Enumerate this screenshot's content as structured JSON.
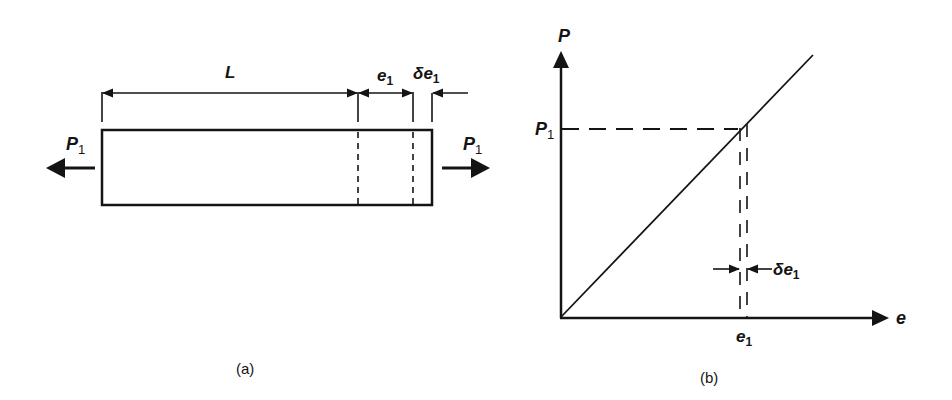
{
  "figure": {
    "panel_a": {
      "caption": "(a)",
      "labels": {
        "length": "L",
        "extension_base": "e",
        "extension_sub": "1",
        "delta_prefix": "δe",
        "delta_sub": "1",
        "load_left": "P",
        "load_left_sub": "1",
        "load_right": "P",
        "load_right_sub": "1"
      }
    },
    "panel_b": {
      "caption": "(b)",
      "axes": {
        "y_label": "P",
        "x_label": "e"
      },
      "labels": {
        "load_tick": "P",
        "load_tick_sub": "1",
        "extension_tick": "e",
        "extension_tick_sub": "1",
        "delta_prefix": "δe",
        "delta_sub": "1"
      }
    },
    "colors": {
      "ink": "#141414",
      "background": "#ffffff"
    }
  }
}
